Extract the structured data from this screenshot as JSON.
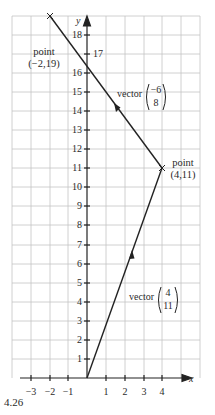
{
  "figure": {
    "caption": "4.26",
    "x_axis_label": "x",
    "y_axis_label": "y",
    "x_ticks": [
      "−3",
      "−2",
      "−1",
      "1",
      "2",
      "3",
      "4"
    ],
    "y_ticks": [
      "1",
      "2",
      "3",
      "4",
      "5",
      "6",
      "7",
      "8",
      "9",
      "10",
      "11",
      "12",
      "13",
      "14",
      "15",
      "16",
      "17",
      "18"
    ],
    "points": [
      {
        "label_line1": "point",
        "label_line2": "(−2,19)",
        "x": -2,
        "y": 19
      },
      {
        "label_line1": "point",
        "label_line2": "(4,11)",
        "x": 4,
        "y": 11
      }
    ],
    "vectors": [
      {
        "word": "vector",
        "top": "4",
        "bottom": "11",
        "from": [
          0,
          0
        ],
        "to": [
          4,
          11
        ]
      },
      {
        "word": "vector",
        "top": "−6",
        "bottom": "8",
        "from": [
          4,
          11
        ],
        "to": [
          -2,
          19
        ]
      }
    ],
    "colors": {
      "grid": "#bdbdbd",
      "axis": "#222222",
      "line": "#222222"
    }
  }
}
